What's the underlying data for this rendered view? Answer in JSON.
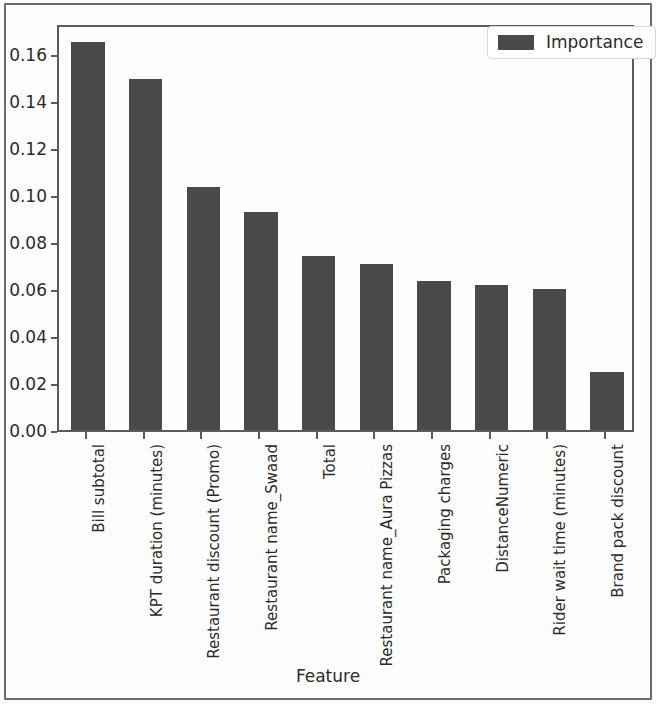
{
  "chart_data": {
    "type": "bar",
    "title": "",
    "xlabel": "Feature",
    "ylabel": "",
    "categories": [
      "Bill subtotal",
      "KPT duration (minutes)",
      "Restaurant discount (Promo)",
      "Restaurant name_Swaad",
      "Total",
      "Restaurant name_Aura Pizzas",
      "Packaging charges",
      "DistanceNumeric",
      "Rider wait time (minutes)",
      "Brand pack discount"
    ],
    "values": [
      0.165,
      0.149,
      0.1035,
      0.0925,
      0.074,
      0.0705,
      0.0635,
      0.0615,
      0.0598,
      0.0247
    ],
    "series": [
      {
        "name": "Importance",
        "values": [
          0.165,
          0.149,
          0.1035,
          0.0925,
          0.074,
          0.0705,
          0.0635,
          0.0615,
          0.0598,
          0.0247
        ],
        "color": "#4a4a4a"
      }
    ],
    "ylim": [
      0.0,
      0.173
    ],
    "yticks": [
      0.0,
      0.02,
      0.04,
      0.06,
      0.08,
      0.1,
      0.12,
      0.14,
      0.16
    ],
    "ytick_labels": [
      "0.00",
      "0.02",
      "0.04",
      "0.06",
      "0.08",
      "0.10",
      "0.12",
      "0.14",
      "0.16"
    ],
    "grid": false,
    "legend": {
      "position": "upper right",
      "entries": [
        {
          "label": "Importance",
          "color": "#4a4a4a",
          "swatch": "legend-swatch-importance"
        }
      ]
    },
    "bar_color": "#4a4a4a",
    "axes_color": "#5b5b5b",
    "background_color": "#fefefe"
  },
  "legend": {
    "importance_label": "Importance"
  },
  "axis": {
    "x_title": "Feature"
  }
}
